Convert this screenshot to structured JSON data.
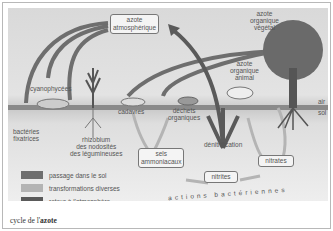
{
  "diagram": {
    "title_caption": {
      "prefix": "cycle de l'",
      "bold": "azote"
    },
    "boxes": {
      "atmospheric": "azote\natmosphérique",
      "ammonia_salts": "sels\nammoniacaux",
      "nitrites": "nitrites",
      "nitrates": "nitrates"
    },
    "labels": {
      "plant_nitrogen": "azote\norganique\nvégétal",
      "animal_nitrogen": "azote\norganique\nanimal",
      "cyanophyceae": "cyanophycées",
      "fixing_bacteria": "bactéries\nfixatrices",
      "rhizobium": "rhizobium\ndes nodosités\ndes légumineuses",
      "corpses": "cadavres",
      "organic_waste": "déchets\norganiques",
      "denitrification": "dénitrification",
      "air": "air",
      "soil": "sol",
      "bacterial_actions": "actions bactériennes"
    },
    "legend": [
      {
        "label": "passage dans le sol",
        "color": "#6e6e6e"
      },
      {
        "label": "transformations diverses",
        "color": "#b4b4b4"
      },
      {
        "label": "retour à l'atmosphère",
        "color": "#5a5a5a"
      }
    ]
  }
}
